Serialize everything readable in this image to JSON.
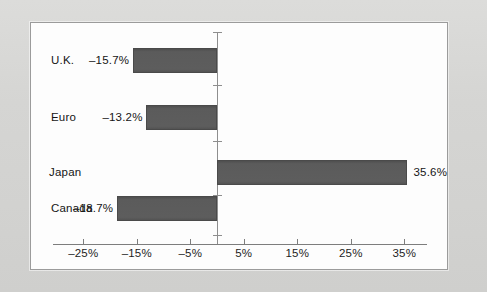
{
  "chart_data": {
    "type": "bar",
    "orientation": "horizontal",
    "title": "",
    "xlabel": "",
    "ylabel": "",
    "categories": [
      "U.K.",
      "Euro",
      "Japan",
      "Canada"
    ],
    "values": [
      -15.7,
      -13.2,
      35.6,
      -18.7
    ],
    "value_labels": [
      "–15.7%",
      "–13.2%",
      "35.6%",
      "–18.7%"
    ],
    "xlim": [
      -30,
      40
    ],
    "xticks": [
      -25,
      -15,
      -5,
      5,
      15,
      25,
      35
    ],
    "xtick_labels": [
      "–25%",
      "–15%",
      "–5%",
      "5%",
      "15%",
      "25%",
      "35%"
    ],
    "grid": false,
    "legend": null,
    "bar_color": "#5a5a5a",
    "axis_color": "#7d7d7d",
    "zero_line": 0,
    "background_color": "#fdfdfd",
    "page_color": "#d7d7d5"
  },
  "series": [
    {
      "category": "U.K.",
      "value": -15.7,
      "label": "–15.7%",
      "label_side": "left"
    },
    {
      "category": "Euro",
      "value": -13.2,
      "label": "–13.2%",
      "label_side": "left"
    },
    {
      "category": "Japan",
      "value": 35.6,
      "label": "35.6%",
      "label_side": "right"
    },
    {
      "category": "Canada",
      "value": -18.7,
      "label": "–18.7%",
      "label_side": "left"
    }
  ]
}
